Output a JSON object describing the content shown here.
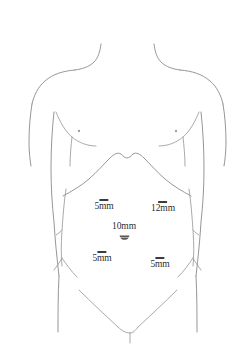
{
  "diagram": {
    "line_color": "#8a8a8f",
    "label_color": "#2e2e2e",
    "marker_color": "#3b3b3b",
    "background_color": "#ffffff"
  },
  "anatomy": {
    "nipple_left": "nipple-marker-left",
    "nipple_right": "nipple-marker-right",
    "umbilicus": "umbilicus-marker",
    "costal_margin": "costal-margin-outline",
    "shoulders": "shoulder-outline",
    "flank_left": "flank-contour-left",
    "flank_right": "flank-contour-right",
    "inguinal_crease": "inguinal-crease-outline"
  },
  "ports": [
    {
      "id": "port-upper-left",
      "label": "5mm",
      "size_mm": 5,
      "position": "left upper quadrant",
      "x": 104,
      "y": 205,
      "mark_width": 9,
      "mark_height": 1.6
    },
    {
      "id": "port-upper-right",
      "label": "12mm",
      "size_mm": 12,
      "position": "right upper quadrant",
      "x": 163,
      "y": 207,
      "mark_width": 9,
      "mark_height": 1.8
    },
    {
      "id": "port-umbilical",
      "label": "10mm",
      "size_mm": 10,
      "position": "supraumbilical midline",
      "x": 124,
      "y": 226,
      "mark_width": 0,
      "mark_height": 0
    },
    {
      "id": "port-lower-left",
      "label": "5mm",
      "size_mm": 5,
      "position": "left lower quadrant",
      "x": 102,
      "y": 257,
      "mark_width": 9,
      "mark_height": 1.6
    },
    {
      "id": "port-lower-right",
      "label": "5mm",
      "size_mm": 5,
      "position": "right lower quadrant",
      "x": 160,
      "y": 263,
      "mark_width": 9,
      "mark_height": 1.6
    }
  ]
}
